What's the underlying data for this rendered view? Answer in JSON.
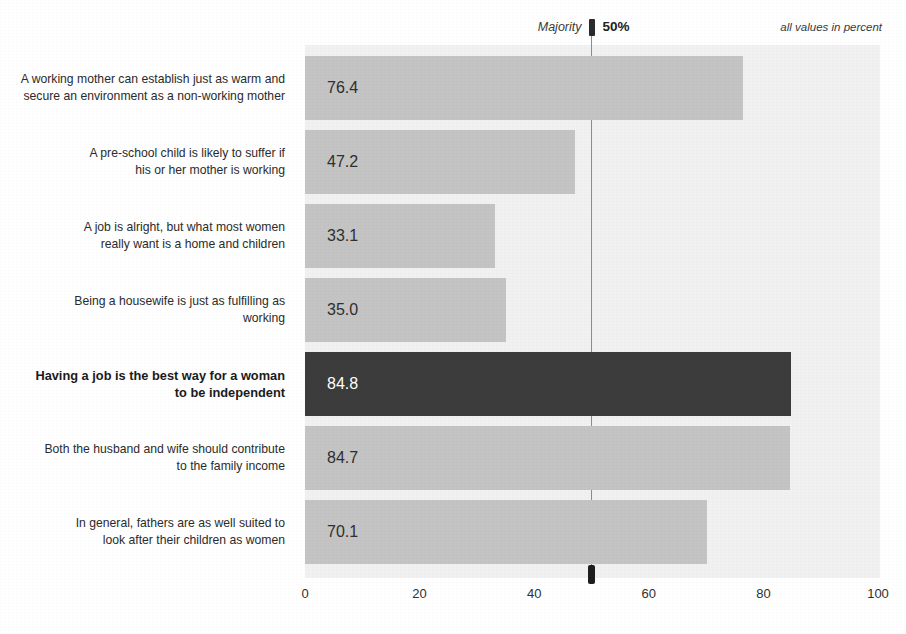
{
  "annotations": {
    "majority_label": "Majority",
    "majority_percent": "50%",
    "units_note": "all values in percent"
  },
  "chart_data": {
    "type": "bar",
    "orientation": "horizontal",
    "title": "",
    "subtitle": "",
    "xlabel": "",
    "ylabel": "",
    "xlim": [
      0,
      100
    ],
    "grid": false,
    "legend": "none",
    "units": "percent",
    "categories": [
      "A working mother can establish just as warm and secure an environment as a non-working mother",
      "A pre-school child is likely to suffer if his or her mother is working",
      "A job is alright, but what most women really want is a home and children",
      "Being a housewife is just as fulfilling as working",
      "Having a job is the best way for a woman to be independent",
      "Both the husband and wife should contribute to the family income",
      "In general, fathers are as well suited to look after their children as women"
    ],
    "values": [
      76.4,
      47.2,
      33.1,
      35.0,
      84.8,
      84.7,
      70.1
    ],
    "value_labels": [
      "76.4",
      "47.2",
      "33.1",
      "35.0",
      "84.8",
      "84.7",
      "70.1"
    ],
    "highlight_index": 4,
    "reference_line": {
      "label": "Majority",
      "value": 50,
      "value_label": "50%"
    },
    "xticks": [
      0,
      20,
      40,
      60,
      80,
      100
    ],
    "xtick_labels": [
      "0",
      "20",
      "40",
      "60",
      "80",
      "100"
    ],
    "colors": {
      "bar": "#c4c4c4",
      "bar_highlight": "#3c3c3c",
      "plot_background": "#f1f1f1",
      "page_background": "#ffffff",
      "text": "#2b2b2b",
      "highlight_text": "#ffffff",
      "reference_line": "#8c8c8c",
      "reference_marker": "#1d1d1d"
    }
  },
  "rows": [
    {
      "label_line_1": "A working mother can establish just as warm and",
      "label_line_2": "secure an environment as a non-working mother",
      "value_label": "76.4"
    },
    {
      "label_line_1": "A pre-school child is likely to suffer if",
      "label_line_2": "his or her mother is working",
      "value_label": "47.2"
    },
    {
      "label_line_1": "A job is alright, but what most women",
      "label_line_2": "really want is a home and children",
      "value_label": "33.1"
    },
    {
      "label_line_1": "Being a housewife is just as fulfilling as",
      "label_line_2": "working",
      "value_label": "35.0"
    },
    {
      "label_line_1": "Having a job is the best way for a woman",
      "label_line_2": "to be independent",
      "value_label": "84.8"
    },
    {
      "label_line_1": "Both the husband and wife should contribute",
      "label_line_2": "to the family income",
      "value_label": "84.7"
    },
    {
      "label_line_1": "In general, fathers are as well suited to",
      "label_line_2": "look after their children as women",
      "value_label": "70.1"
    }
  ]
}
